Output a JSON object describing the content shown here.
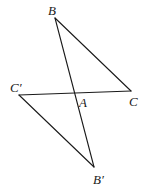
{
  "diagram": {
    "type": "geometry",
    "stroke_color": "#1a1a1a",
    "background_color": "#ffffff",
    "points": {
      "B": {
        "label": "B",
        "x": 55,
        "y": 18
      },
      "C": {
        "label": "C",
        "x": 131,
        "y": 91
      },
      "Cp": {
        "label": "C′",
        "x": 19,
        "y": 95
      },
      "Bp": {
        "label": "B′",
        "x": 94,
        "y": 167
      },
      "A": {
        "label": "A",
        "x": 75,
        "y": 93
      }
    },
    "segments": [
      {
        "from": "B",
        "to": "Bp"
      },
      {
        "from": "B",
        "to": "C"
      },
      {
        "from": "Cp",
        "to": "C"
      },
      {
        "from": "Cp",
        "to": "Bp"
      }
    ],
    "labels": {
      "B": {
        "text": "B",
        "x": 48,
        "y": 15
      },
      "Cp": {
        "text": "C′",
        "x": 10,
        "y": 92
      },
      "A": {
        "text": "A",
        "x": 79,
        "y": 107
      },
      "C": {
        "text": "C",
        "x": 129,
        "y": 106
      },
      "Bp": {
        "text": "B′",
        "x": 93,
        "y": 184
      }
    }
  }
}
